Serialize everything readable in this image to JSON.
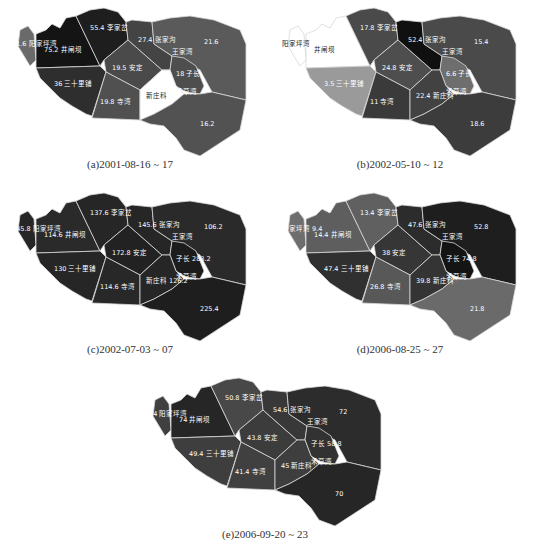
{
  "figure": {
    "panels": [
      {
        "id": "a",
        "caption": "(a)2001-08-16 ~ 17",
        "fills": {
          "yangjiaping": "#6a6a6a",
          "jingkou": "#141414",
          "lijiatuo": "#1e1e1e",
          "sanshilipu": "#2e2e2e",
          "anning": "#4a4a4a",
          "siwan": "#505050",
          "zhangjiagou": "#444444",
          "east_north": "#5a5a5a",
          "zichang": "#4e4e4e",
          "xinzhuang": "#ffffff",
          "south": "#525252"
        },
        "labels": {
          "yangjiaping": "11.6 阳家坪湾",
          "jingkou": "75.2 井闸坝",
          "lijiatuo": "55.4 李家岔",
          "sanshilipu": "36 三十里铺",
          "anning": "19.5 安定",
          "siwan": "19.8 寺湾",
          "zhangjiagou": "27.4 张家沟",
          "wangjiawan": "王家湾",
          "east_north": "21.6",
          "zichang": "18 子长",
          "xinzhuang": "新庄科",
          "heyanwan": "禾草湾",
          "south": "16.2"
        }
      },
      {
        "id": "b",
        "caption": "(b)2002-05-10 ~ 12",
        "fills": {
          "yangjiaping": "#ffffff",
          "jingkou": "#ffffff",
          "lijiatuo": "#4a4a4a",
          "sanshilipu": "#9a9a9a",
          "anning": "#4e4e4e",
          "siwan": "#3a3a3a",
          "zhangjiagou": "#101010",
          "east_north": "#4a4a4a",
          "zichang": "#6e6e6e",
          "xinzhuang": "#424242",
          "south": "#3c3c3c"
        },
        "labels": {
          "yangjiaping": "阳家坪湾",
          "jingkou": "井闸坝",
          "lijiatuo": "17.8 李家岔",
          "sanshilipu": "3.5 三十里铺",
          "anning": "24.8 安定",
          "siwan": "11 寺湾",
          "zhangjiagou": "52.4 张家沟",
          "wangjiawan": "王家湾",
          "east_north": "15.4",
          "zichang": "6.6 子长",
          "xinzhuang": "22.4 新庄科",
          "heyanwan": "禾草湾",
          "south": "18.6"
        }
      },
      {
        "id": "c",
        "caption": "(c)2002-07-03 ~ 07",
        "fills": {
          "yangjiaping": "#262626",
          "jingkou": "#2a2a2a",
          "lijiatuo": "#262626",
          "sanshilipu": "#262626",
          "anning": "#222222",
          "siwan": "#282828",
          "zhangjiagou": "#262626",
          "east_north": "#2a2a2a",
          "zichang": "#1c1c1c",
          "xinzhuang": "#262626",
          "south": "#1e1e1e"
        },
        "labels": {
          "yangjiaping": "145.8 阳家坪湾",
          "jingkou": "114.6 井闸坝",
          "lijiatuo": "137.6 李家岔",
          "sanshilipu": "130 三十里铺",
          "anning": "172.8 安定",
          "siwan": "114.6 寺湾",
          "zhangjiagou": "145.6 张家沟",
          "wangjiawan": "王家湾",
          "east_north": "106.2",
          "zichang": "子长 283.2",
          "xinzhuang": "新庄科 126.2",
          "heyanwan": "禾草湾",
          "south": "225.4"
        }
      },
      {
        "id": "d",
        "caption": "(d)2006-08-25 ~ 27",
        "fills": {
          "yangjiaping": "#6e6e6e",
          "jingkou": "#5e5e5e",
          "lijiatuo": "#606060",
          "sanshilipu": "#303030",
          "anning": "#363636",
          "siwan": "#585858",
          "zhangjiagou": "#2c2c2c",
          "east_north": "#1e1e1e",
          "zichang": "#141414",
          "xinzhuang": "#343434",
          "south": "#6a6a6a"
        },
        "labels": {
          "yangjiaping": "阳家坪湾 9.4",
          "jingkou": "14.4 井闸坝",
          "lijiatuo": "13.4 李家岔",
          "sanshilipu": "47.4 三十里铺",
          "anning": "38 安定",
          "siwan": "26.8 寺湾",
          "zhangjiagou": "47.6 张家沟",
          "wangjiawan": "王家湾",
          "east_north": "52.8",
          "zichang": "子长 74.8",
          "xinzhuang": "39.8 新庄科",
          "heyanwan": "禾草湾",
          "south": "21.8"
        }
      },
      {
        "id": "e",
        "caption": "(e)2006-09-20 ~ 23",
        "fills": {
          "yangjiaping": "#404040",
          "jingkou": "#262626",
          "lijiatuo": "#484848",
          "sanshilipu": "#3e3e3e",
          "anning": "#3c3c3c",
          "siwan": "#404040",
          "zhangjiagou": "#383838",
          "east_north": "#2c2c2c",
          "zichang": "#323232",
          "xinzhuang": "#3e3e3e",
          "south": "#262626"
        },
        "labels": {
          "yangjiaping": "3.4 阳家坪湾",
          "jingkou": "74 井闸坝",
          "lijiatuo": "50.8 李家岔",
          "sanshilipu": "49.4 三十里铺",
          "anning": "43.8 安定",
          "siwan": "41.4 寺湾",
          "zhangjiagou": "54.6 张家沟",
          "wangjiawan": "王家湾",
          "east_north": "72",
          "zichang": "子长 58.8",
          "xinzhuang": "45 新庄科",
          "heyanwan": "禾草湾",
          "south": "70"
        }
      }
    ]
  }
}
